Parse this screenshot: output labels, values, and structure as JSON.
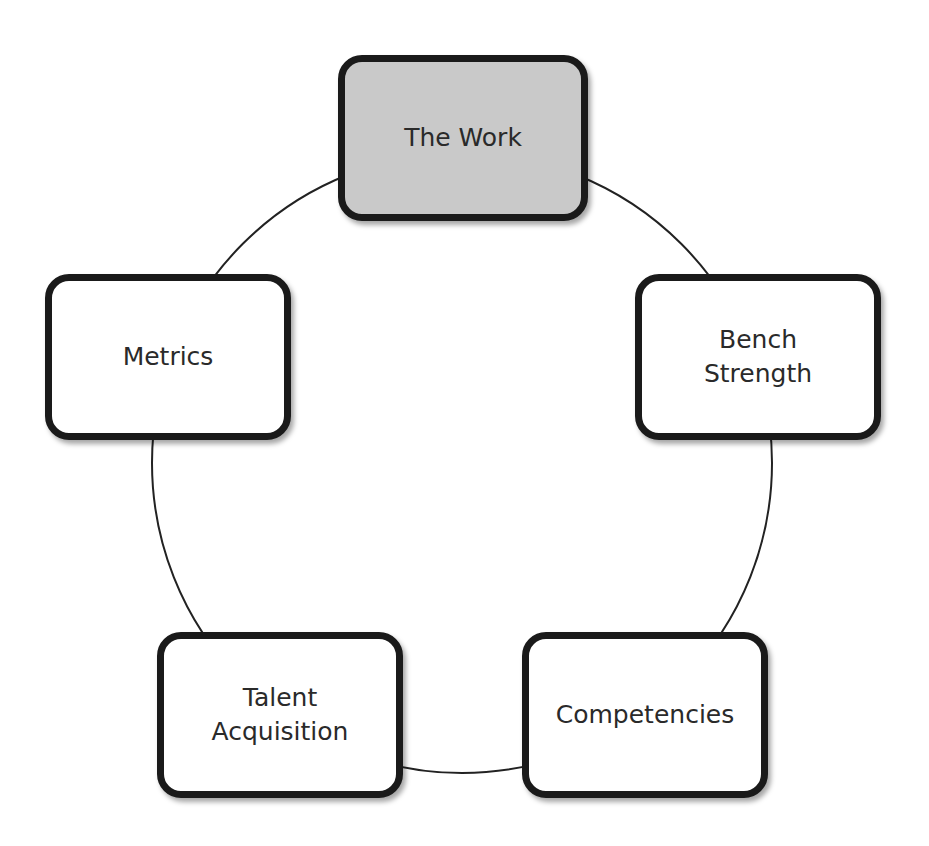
{
  "diagram": {
    "type": "cycle",
    "connector": "circle",
    "colors": {
      "highlight_fill": "#c9c9c9",
      "default_fill": "#ffffff",
      "border": "#1a1a1a",
      "text": "#2a2a2a",
      "connector": "#222222"
    },
    "nodes": [
      {
        "id": "the-work",
        "label": "The Work",
        "highlighted": true
      },
      {
        "id": "bench-strength",
        "label": "Bench\nStrength",
        "highlighted": false
      },
      {
        "id": "competencies",
        "label": "Competencies",
        "highlighted": false
      },
      {
        "id": "talent-acquisition",
        "label": "Talent\nAcquisition",
        "highlighted": false
      },
      {
        "id": "metrics",
        "label": "Metrics",
        "highlighted": false
      }
    ]
  }
}
